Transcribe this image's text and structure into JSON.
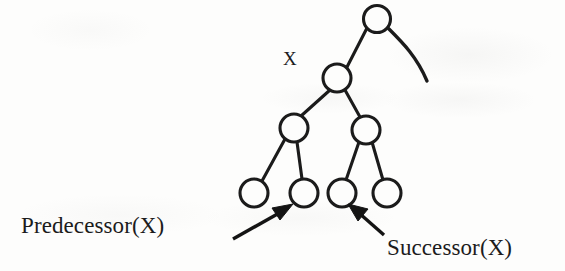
{
  "diagram": {
    "type": "binary-search-tree",
    "title_label": "X",
    "background_color": "#fdfdfc",
    "ink_color": "#1b1b1b",
    "annotations": {
      "node_label": "X",
      "predecessor_label": "Predecessor(X)",
      "successor_label": "Successor(X)"
    },
    "nodes": [
      {
        "id": "root",
        "name": "root-node",
        "cx": 377,
        "cy": 19,
        "r": 14
      },
      {
        "id": "x",
        "name": "node-x",
        "cx": 337,
        "cy": 78,
        "r": 14
      },
      {
        "id": "left",
        "name": "left-child-node",
        "cx": 294,
        "cy": 128,
        "r": 14
      },
      {
        "id": "right",
        "name": "right-child-node",
        "cx": 366,
        "cy": 130,
        "r": 14
      },
      {
        "id": "leaf1",
        "name": "leaf-node-1",
        "cx": 254,
        "cy": 193,
        "r": 14
      },
      {
        "id": "predecessor",
        "name": "predecessor-leaf-node",
        "cx": 304,
        "cy": 193,
        "r": 14
      },
      {
        "id": "successor",
        "name": "successor-leaf-node",
        "cx": 342,
        "cy": 193,
        "r": 14
      },
      {
        "id": "leaf4",
        "name": "leaf-node-4",
        "cx": 387,
        "cy": 193,
        "r": 14
      }
    ],
    "edges": [
      {
        "name": "edge-root-to-x",
        "from": "root",
        "to": "x"
      },
      {
        "name": "edge-x-to-left",
        "from": "x",
        "to": "left"
      },
      {
        "name": "edge-x-to-right",
        "from": "x",
        "to": "right"
      },
      {
        "name": "edge-left-to-leaf1",
        "from": "left",
        "to": "leaf1"
      },
      {
        "name": "edge-left-to-predecessor",
        "from": "left",
        "to": "predecessor"
      },
      {
        "name": "edge-right-to-successor",
        "from": "right",
        "to": "successor"
      },
      {
        "name": "edge-right-to-leaf4",
        "from": "right",
        "to": "leaf4"
      }
    ],
    "parent_curve": {
      "name": "root-parent-curve",
      "path": "M 388 28 C 404 44 419 58 428 82"
    },
    "arrows": [
      {
        "name": "predecessor-arrow",
        "points_to": "predecessor",
        "tail_x": 233,
        "tail_y": 238,
        "tip_x": 291,
        "tip_y": 205
      },
      {
        "name": "successor-arrow",
        "points_to": "successor",
        "tail_x": 383,
        "tail_y": 234,
        "tip_x": 350,
        "tip_y": 205
      }
    ]
  }
}
